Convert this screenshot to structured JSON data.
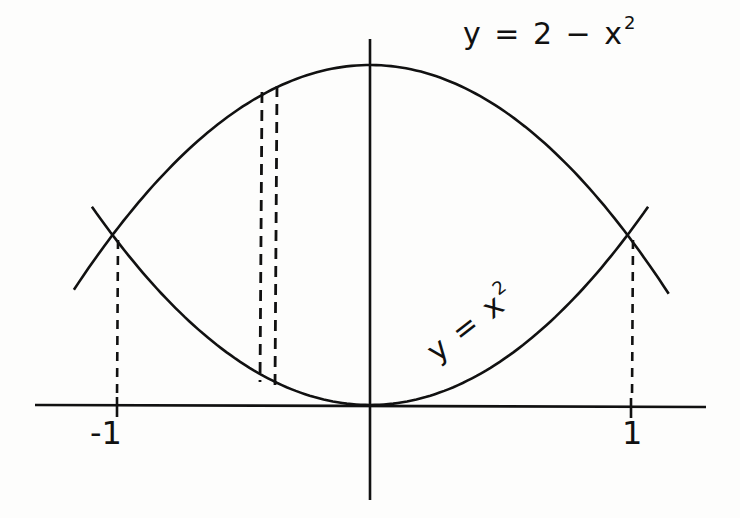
{
  "figure": {
    "type": "region-between-curves",
    "colors": {
      "stroke": "#111111",
      "background": "#fdfdfc"
    }
  },
  "labels": {
    "upper_curve": {
      "y": "y",
      "eq": "=",
      "rhs": "2 − x",
      "exp": "2"
    },
    "lower_curve": {
      "y": "y",
      "eq": "=",
      "rhs": "x",
      "exp": "2"
    },
    "x_tick_neg": "-1",
    "x_tick_pos": "1"
  },
  "curves": [
    {
      "name": "upper",
      "equation": "y = 2 - x^2",
      "x_range": [
        -1.15,
        1.16
      ]
    },
    {
      "name": "lower",
      "equation": "y = x^2",
      "x_range": [
        -1.08,
        1.08
      ]
    }
  ],
  "intersections": [
    {
      "x": -1,
      "y": 1
    },
    {
      "x": 1,
      "y": 1
    }
  ],
  "strip": {
    "x_left": -0.42,
    "x_right": -0.36,
    "style": "dashed"
  },
  "axes": {
    "x_ticks": [
      -1,
      1
    ],
    "origin_px": [
      370,
      405
    ]
  }
}
